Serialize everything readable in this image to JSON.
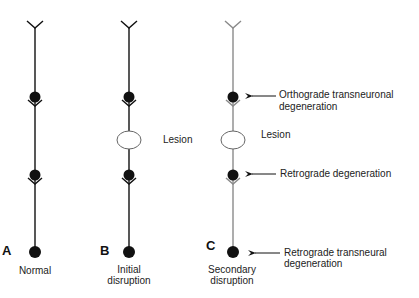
{
  "panels": [
    {
      "letter": "A",
      "caption_line1": "Normal",
      "caption_line2": ""
    },
    {
      "letter": "B",
      "caption_line1": "Initial",
      "caption_line2": "disruption"
    },
    {
      "letter": "C",
      "caption_line1": "Secondary",
      "caption_line2": "disruption"
    }
  ],
  "lesion_label_b": "Lesion",
  "lesion_label_c": "Lesion",
  "annotations": {
    "orthograde_line1": "Orthograde transneuronal",
    "orthograde_line2": "degeneration",
    "retrograde": "Retrograde degeneration",
    "retro_trans_line1": "Retrograde transneural",
    "retro_trans_line2": "degeneration"
  },
  "colors": {
    "normal_neuron": "#111111",
    "degenerated_neuron": "#8a8a8a",
    "lesion_outline": "#666666"
  }
}
